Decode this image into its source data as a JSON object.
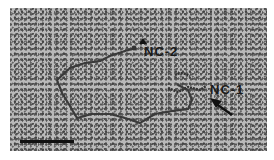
{
  "image": {
    "type": "electron micrograph",
    "background_color": "#b9b9b9",
    "strand_color": "#3a3a3a"
  },
  "labels": {
    "nc2": "NC-2",
    "nc1": "NC-1"
  },
  "annotations": {
    "nc2_marker": "arrowhead-up",
    "nc1_marker": "arrow-pointing-up-left"
  },
  "scale_bar": {
    "color": "#111111"
  }
}
